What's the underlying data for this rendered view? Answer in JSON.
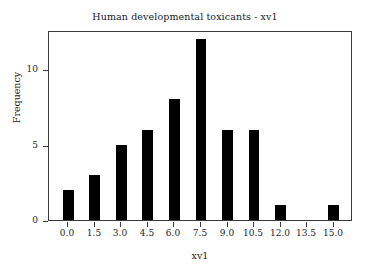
{
  "chart_data": {
    "type": "bar",
    "title": "Human developmental toxicants - xv1",
    "xlabel": "xv1",
    "ylabel": "Frequency",
    "categories": [
      "0.0",
      "1.5",
      "3.0",
      "4.5",
      "6.0",
      "7.5",
      "9.0",
      "10.5",
      "12.0",
      "13.5",
      "15.0"
    ],
    "values": [
      2,
      3,
      5,
      6,
      8,
      12,
      6,
      6,
      1,
      0,
      1
    ],
    "x_tick_labels": [
      "0.0",
      "1.5",
      "3.0",
      "4.5",
      "6.0",
      "7.5",
      "9.0",
      "10.5",
      "12.0",
      "13.5",
      "15.0"
    ],
    "x_tick_values": [
      0.0,
      1.5,
      3.0,
      4.5,
      6.0,
      7.5,
      9.0,
      10.5,
      12.0,
      13.5,
      15.0
    ],
    "y_tick_labels": [
      "0",
      "5",
      "10"
    ],
    "y_tick_values": [
      0,
      5,
      10
    ],
    "xlim": [
      -1.1,
      16.1
    ],
    "ylim": [
      0,
      12.6
    ],
    "grid": false,
    "legend": false,
    "bar_color": "#000000",
    "frame_color": "#3b3b3b",
    "text_color": "#1a1a1a",
    "background": "#ffffff",
    "bar_width_data_units": 0.62
  }
}
